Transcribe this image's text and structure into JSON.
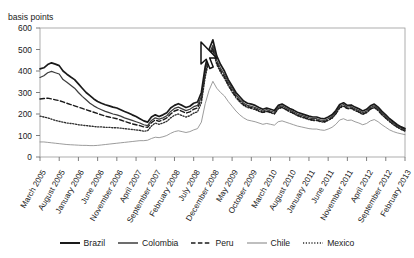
{
  "chart": {
    "title": "",
    "axis_unit_label": "basis points",
    "ylabel": "basis points",
    "xlabel": ""
  },
  "yticks": [
    "600",
    "500",
    "400",
    "300",
    "200",
    "100",
    "0"
  ],
  "legend": {
    "items": [
      {
        "label": "Brazil",
        "style": "solid-thick",
        "color": "#1a1a1a"
      },
      {
        "label": "Colombia",
        "style": "solid",
        "color": "#444444"
      },
      {
        "label": "Peru",
        "style": "dashed",
        "color": "#1a1a1a"
      },
      {
        "label": "Chile",
        "style": "solid-thin",
        "color": "#8a8a8a"
      },
      {
        "label": "Mexico",
        "style": "dotted",
        "color": "#333333"
      }
    ]
  },
  "chart_data": {
    "type": "line",
    "title": "",
    "xlabel": "",
    "ylabel": "basis points",
    "ylim": [
      0,
      600
    ],
    "yticks": [
      0,
      100,
      200,
      300,
      400,
      500,
      600
    ],
    "grid": false,
    "legend_position": "bottom",
    "x_tick_labels": [
      "March 2005",
      "August 2005",
      "January 2006",
      "June 2006",
      "November 2006",
      "April 2007",
      "September 2007",
      "February 2008",
      "July 2008",
      "December 2008",
      "May 2009",
      "October 2009",
      "March 2010",
      "August 2010",
      "January 2011",
      "June 2011",
      "November 2011",
      "April 2012",
      "September 2012",
      "February 2013"
    ],
    "x_tick_interval_months": 5,
    "x_start": "March 2005",
    "x_end": "February 2013",
    "x": [
      "2005-03",
      "2005-04",
      "2005-05",
      "2005-06",
      "2005-07",
      "2005-08",
      "2005-09",
      "2005-10",
      "2005-11",
      "2005-12",
      "2006-01",
      "2006-02",
      "2006-03",
      "2006-04",
      "2006-05",
      "2006-06",
      "2006-07",
      "2006-08",
      "2006-09",
      "2006-10",
      "2006-11",
      "2006-12",
      "2007-01",
      "2007-02",
      "2007-03",
      "2007-04",
      "2007-05",
      "2007-06",
      "2007-07",
      "2007-08",
      "2007-09",
      "2007-10",
      "2007-11",
      "2007-12",
      "2008-01",
      "2008-02",
      "2008-03",
      "2008-04",
      "2008-05",
      "2008-06",
      "2008-07",
      "2008-08",
      "2008-09",
      "2008-10",
      "2008-11",
      "2008-12",
      "2009-01",
      "2009-02",
      "2009-03",
      "2009-04",
      "2009-05",
      "2009-06",
      "2009-07",
      "2009-08",
      "2009-09",
      "2009-10",
      "2009-11",
      "2009-12",
      "2010-01",
      "2010-02",
      "2010-03",
      "2010-04",
      "2010-05",
      "2010-06",
      "2010-07",
      "2010-08",
      "2010-09",
      "2010-10",
      "2010-11",
      "2010-12",
      "2011-01",
      "2011-02",
      "2011-03",
      "2011-04",
      "2011-05",
      "2011-06",
      "2011-07",
      "2011-08",
      "2011-09",
      "2011-10",
      "2011-11",
      "2011-12",
      "2012-01",
      "2012-02",
      "2012-03",
      "2012-04",
      "2012-05",
      "2012-06",
      "2012-07",
      "2012-08",
      "2012-09",
      "2012-10",
      "2012-11",
      "2012-12",
      "2013-01",
      "2013-02"
    ],
    "series": [
      {
        "name": "Brazil",
        "style": "solid-thick",
        "color": "#1a1a1a",
        "values": [
          410,
          415,
          430,
          438,
          432,
          425,
          400,
          385,
          372,
          360,
          340,
          320,
          300,
          285,
          270,
          258,
          250,
          243,
          238,
          232,
          228,
          220,
          212,
          205,
          196,
          188,
          178,
          168,
          162,
          186,
          196,
          188,
          196,
          206,
          228,
          240,
          248,
          240,
          230,
          236,
          250,
          256,
          300,
          420,
          500,
          545,
          470,
          430,
          400,
          360,
          330,
          300,
          280,
          260,
          250,
          246,
          240,
          230,
          222,
          228,
          222,
          216,
          240,
          246,
          236,
          226,
          218,
          208,
          202,
          196,
          190,
          186,
          186,
          180,
          178,
          186,
          196,
          216,
          244,
          252,
          240,
          242,
          232,
          224,
          214,
          222,
          238,
          246,
          232,
          212,
          196,
          178,
          164,
          150,
          140,
          132
        ]
      },
      {
        "name": "Colombia",
        "style": "solid",
        "color": "#444444",
        "values": [
          370,
          378,
          392,
          398,
          392,
          386,
          360,
          348,
          334,
          320,
          300,
          282,
          266,
          250,
          238,
          228,
          220,
          212,
          206,
          200,
          196,
          190,
          182,
          176,
          170,
          164,
          158,
          150,
          146,
          170,
          182,
          176,
          182,
          192,
          212,
          226,
          232,
          224,
          216,
          222,
          234,
          240,
          282,
          400,
          478,
          520,
          450,
          412,
          384,
          348,
          318,
          290,
          268,
          250,
          240,
          236,
          230,
          222,
          214,
          220,
          214,
          208,
          232,
          238,
          228,
          218,
          210,
          200,
          194,
          188,
          182,
          178,
          178,
          172,
          170,
          178,
          188,
          208,
          236,
          244,
          232,
          234,
          224,
          216,
          206,
          214,
          230,
          238,
          224,
          204,
          188,
          170,
          156,
          144,
          134,
          126
        ]
      },
      {
        "name": "Peru",
        "style": "dashed",
        "color": "#1a1a1a",
        "values": [
          270,
          272,
          274,
          270,
          266,
          262,
          256,
          250,
          244,
          238,
          232,
          226,
          220,
          214,
          208,
          202,
          196,
          190,
          186,
          182,
          178,
          172,
          166,
          160,
          154,
          150,
          146,
          140,
          138,
          160,
          172,
          166,
          172,
          182,
          200,
          214,
          220,
          212,
          204,
          210,
          222,
          228,
          270,
          388,
          466,
          508,
          440,
          402,
          374,
          338,
          308,
          282,
          260,
          244,
          234,
          230,
          224,
          216,
          208,
          214,
          208,
          202,
          226,
          232,
          222,
          212,
          204,
          194,
          188,
          182,
          176,
          172,
          172,
          166,
          164,
          172,
          182,
          202,
          230,
          238,
          226,
          228,
          218,
          210,
          200,
          208,
          224,
          232,
          218,
          198,
          182,
          166,
          152,
          140,
          130,
          122
        ]
      },
      {
        "name": "Chile",
        "style": "solid-thin",
        "color": "#8a8a8a",
        "values": [
          70,
          70,
          68,
          66,
          64,
          62,
          60,
          58,
          57,
          56,
          55,
          54,
          54,
          53,
          53,
          54,
          56,
          58,
          60,
          62,
          64,
          66,
          68,
          70,
          72,
          74,
          76,
          76,
          78,
          86,
          92,
          90,
          94,
          100,
          110,
          118,
          122,
          118,
          114,
          118,
          126,
          132,
          162,
          248,
          310,
          352,
          320,
          300,
          284,
          258,
          236,
          214,
          196,
          182,
          172,
          168,
          164,
          158,
          152,
          156,
          152,
          148,
          164,
          168,
          162,
          156,
          150,
          144,
          140,
          136,
          132,
          130,
          130,
          126,
          124,
          130,
          138,
          152,
          172,
          178,
          170,
          172,
          164,
          158,
          150,
          156,
          168,
          174,
          164,
          150,
          138,
          126,
          118,
          112,
          108,
          104
        ]
      },
      {
        "name": "Mexico",
        "style": "dotted",
        "color": "#333333",
        "values": [
          190,
          186,
          182,
          176,
          170,
          166,
          162,
          158,
          156,
          154,
          150,
          148,
          146,
          144,
          142,
          140,
          140,
          138,
          138,
          136,
          136,
          134,
          132,
          130,
          128,
          126,
          124,
          120,
          122,
          144,
          158,
          152,
          158,
          166,
          182,
          194,
          200,
          192,
          186,
          192,
          204,
          210,
          252,
          372,
          452,
          496,
          430,
          394,
          366,
          332,
          302,
          276,
          256,
          240,
          230,
          226,
          220,
          212,
          206,
          212,
          206,
          200,
          224,
          230,
          220,
          210,
          202,
          192,
          186,
          180,
          174,
          170,
          170,
          164,
          162,
          170,
          180,
          200,
          228,
          236,
          224,
          226,
          216,
          208,
          198,
          206,
          222,
          230,
          216,
          196,
          180,
          164,
          150,
          138,
          128,
          120
        ]
      }
    ]
  },
  "cursor": {
    "name": "mouse-pointer",
    "x": 199,
    "y": 41
  }
}
